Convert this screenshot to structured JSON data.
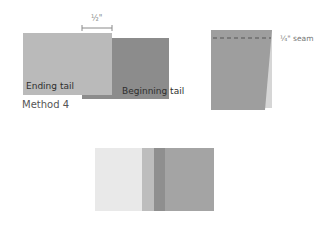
{
  "figure_left": {
    "dimension_label": "½\"",
    "ending_tail_label": "Ending tail",
    "beginning_tail_label": "Beginning tail",
    "caption": "Method 4",
    "colors": {
      "ending_tail": "#bababa",
      "beginning_tail": "#8c8c8c",
      "dimension_line": "#8a8a8a"
    }
  },
  "figure_right": {
    "seam_label": "¼\" seam",
    "colors": {
      "front_panel": "#9e9e9e",
      "back_panel": "#d6d6d6",
      "seam_dashes": "#6e6e6e"
    }
  },
  "figure_bottom": {
    "bands": [
      {
        "name": "ending-tail-face",
        "color": "#e9e9e9",
        "width": 47
      },
      {
        "name": "seam-allowance-light",
        "color": "#bdbdbd",
        "width": 12
      },
      {
        "name": "seam-allowance-dark",
        "color": "#8f8f8f",
        "width": 11
      },
      {
        "name": "beginning-tail-face",
        "color": "#a4a4a4",
        "width": 49
      }
    ]
  }
}
